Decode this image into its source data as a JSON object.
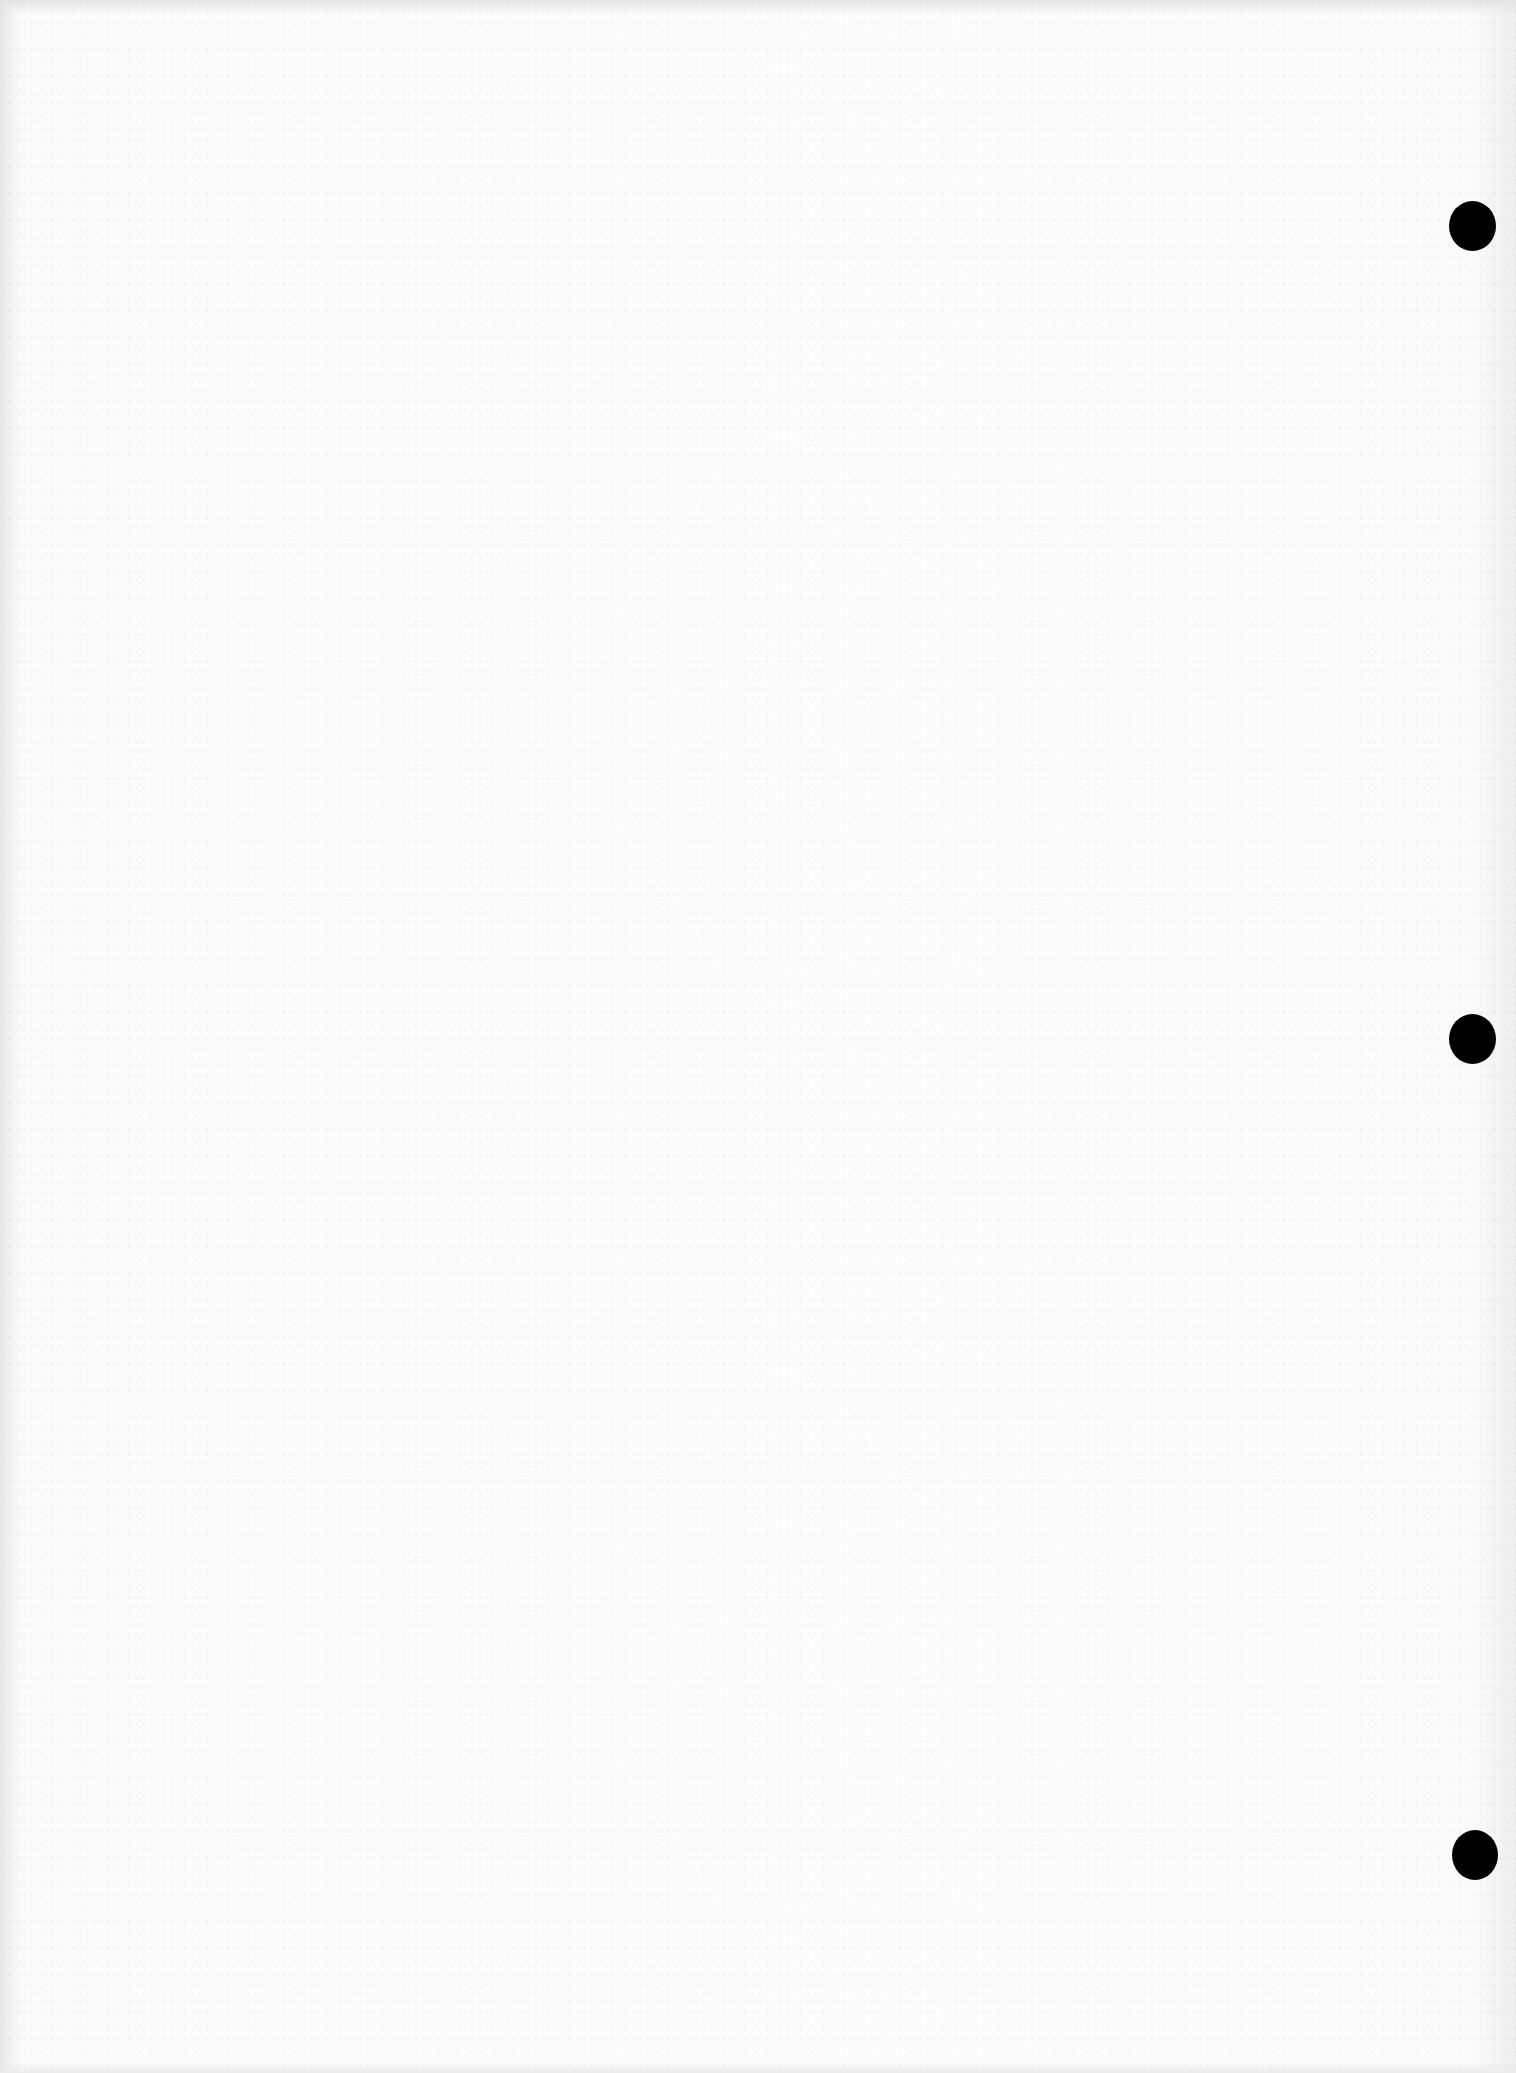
{
  "document": {
    "type": "scanned-blank-page",
    "content_text": "",
    "background_color": "#fcfcfc",
    "punch_holes": [
      {
        "position": "top",
        "color": "#000000"
      },
      {
        "position": "middle",
        "color": "#000000"
      },
      {
        "position": "bottom",
        "color": "#000000"
      }
    ]
  }
}
